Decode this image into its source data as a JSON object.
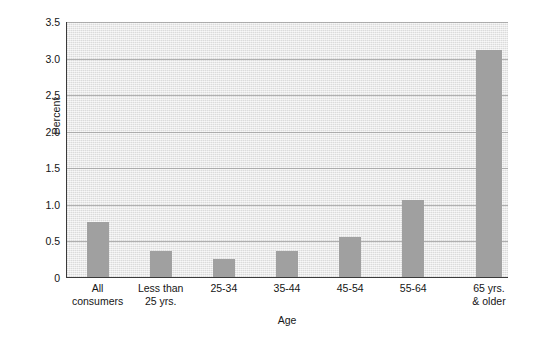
{
  "chart_data": {
    "type": "bar",
    "title": "",
    "subtitle": "",
    "xlabel": "Age",
    "ylabel": "Percent",
    "categories": [
      "All\nconsumers",
      "Less than\n25 yrs.",
      "25-34",
      "35-44",
      "45-54",
      "55-64",
      "65 yrs.\n& older"
    ],
    "values": [
      0.75,
      0.35,
      0.25,
      0.35,
      0.55,
      1.05,
      3.1
    ],
    "ylim": [
      0,
      3.5
    ],
    "yticks": [
      0,
      0.5,
      1.0,
      1.5,
      2.0,
      2.5,
      3.0,
      3.5
    ],
    "ytick_labels": [
      "0",
      "0.5",
      "1.0",
      "1.5",
      "2.0",
      "2.5",
      "3.0",
      "3.5"
    ],
    "grid": true,
    "legend": "none",
    "bar_color": "#a0a0a0",
    "plot_background": "#e4e4e4",
    "axis_color": "#3a3a3a",
    "gridline_color": "#9a9a9a"
  }
}
